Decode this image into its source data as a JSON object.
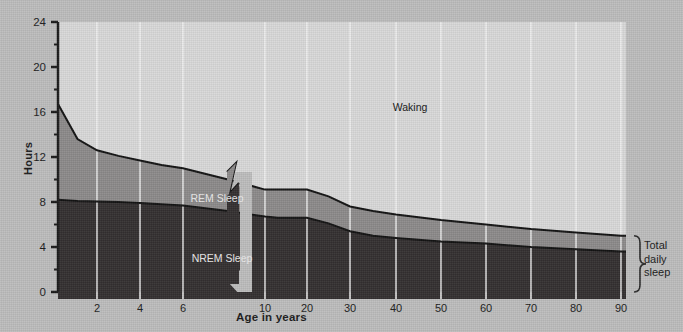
{
  "chart_data": {
    "type": "area",
    "title": "",
    "xlabel": "Age in years",
    "ylabel": "Hours",
    "ylim": [
      0,
      24
    ],
    "yticks": [
      0,
      4,
      8,
      12,
      16,
      20,
      24
    ],
    "yticks_minor": [
      2,
      6,
      10,
      14,
      18,
      22
    ],
    "xticks": [
      "2",
      "4",
      "6",
      "10",
      "20",
      "30",
      "40",
      "50",
      "60",
      "70",
      "80",
      "90"
    ],
    "x_axis_break": true,
    "x_axis_break_note": "axis break between 6 and 10 years",
    "grid": "vertical-white-gridlines",
    "legend": "inline-area-labels",
    "series": [
      {
        "name": "NREM Sleep",
        "label": "NREM Sleep",
        "color": "#332f30",
        "x": [
          0,
          1,
          2,
          3,
          4,
          5,
          6,
          9,
          10,
          13,
          20,
          25,
          30,
          35,
          40,
          50,
          60,
          70,
          80,
          90
        ],
        "values": [
          8.2,
          8.1,
          8.05,
          8.0,
          7.9,
          7.8,
          7.7,
          7.2,
          6.7,
          6.6,
          6.6,
          6.1,
          5.4,
          5.0,
          4.8,
          4.5,
          4.3,
          4.0,
          3.8,
          3.6
        ]
      },
      {
        "name": "REM Sleep",
        "label": "REM Sleep",
        "color": "#8c8a8a",
        "x": [
          0,
          1,
          2,
          3,
          4,
          5,
          6,
          9,
          10,
          13,
          20,
          25,
          30,
          35,
          40,
          50,
          60,
          70,
          80,
          90
        ],
        "total_sleep_values": [
          16.7,
          13.6,
          12.6,
          12.1,
          11.7,
          11.3,
          11.0,
          10.0,
          9.1,
          9.1,
          9.1,
          8.5,
          7.6,
          7.2,
          6.9,
          6.4,
          6.0,
          5.6,
          5.3,
          5.0
        ]
      },
      {
        "name": "Waking",
        "label": "Waking",
        "color": "#d9d9d9",
        "description": "region above total sleep curve up to 24 hours"
      }
    ],
    "annotations": [
      {
        "text": "Waking",
        "x_axis_value": 40,
        "y_axis_value": 17.5
      },
      {
        "text": "REM Sleep",
        "x_axis_value": 6.5,
        "y_axis_value": 9.2
      },
      {
        "text": "NREM Sleep",
        "x_axis_value": 7.5,
        "y_axis_value": 3.9
      }
    ],
    "bracket": {
      "label_lines": [
        "Total",
        "daily",
        "sleep"
      ],
      "spans_from": 0,
      "spans_to": 5.0
    }
  },
  "colors": {
    "background": "#bdbdbd",
    "waking": "#d9d9d9",
    "rem": "#8c8a8a",
    "nrem": "#332f30",
    "axis": "#1a1a1a",
    "gridline": "#f2f2f2",
    "text": "#1a1a1a"
  }
}
